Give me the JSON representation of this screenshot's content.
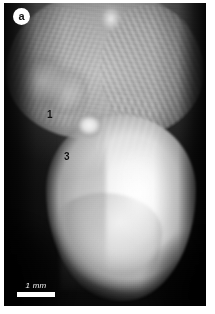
{
  "figure": {
    "panel_label": "a",
    "modality": "grayscale micrograph",
    "markers": [
      {
        "id": "1",
        "label": "1"
      },
      {
        "id": "3",
        "label": "3"
      }
    ],
    "scalebar": {
      "label": "1 mm",
      "length_px": 38,
      "value": 1,
      "unit": "mm",
      "color": "#ffffff"
    },
    "colors": {
      "background": "#ffffff",
      "plate_dark": "#0a0a0a",
      "specimen_bright": "#fdfdfd",
      "marker_text": "#0d0d0d",
      "badge_background": "#ffffff",
      "badge_text": "#151515"
    },
    "regions": {
      "upper_tissue": "fibrous striated mass",
      "bright_nodule": "rounded bright nodule",
      "lower_body": "large bright ovoid body"
    }
  }
}
